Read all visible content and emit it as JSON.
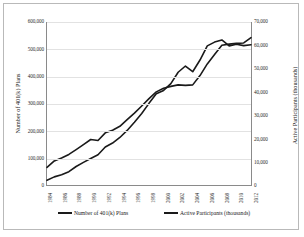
{
  "chart_data": {
    "type": "line",
    "title": "",
    "xlabel": "",
    "ylabel": "Number of 401(k) Plans",
    "y2label": "Active Participants (thousands)",
    "grid": true,
    "legend_position": "bottom",
    "x": [
      1984,
      1985,
      1986,
      1987,
      1988,
      1989,
      1990,
      1991,
      1992,
      1993,
      1994,
      1995,
      1996,
      1997,
      1998,
      1999,
      2000,
      2001,
      2002,
      2003,
      2004,
      2005,
      2006,
      2007,
      2008,
      2009,
      2010,
      2011,
      2012
    ],
    "xtick_labels": [
      "1984",
      "1986",
      "1988",
      "1990",
      "1992",
      "1994",
      "1996",
      "1998",
      "2000",
      "2002",
      "2004",
      "2006",
      "2008",
      "2010",
      "2012"
    ],
    "xtick_values": [
      1984,
      1986,
      1988,
      1990,
      1992,
      1994,
      1996,
      1998,
      2000,
      2002,
      2004,
      2006,
      2008,
      2010,
      2012
    ],
    "ylim": [
      0,
      600000
    ],
    "ytick_labels": [
      "0",
      "100,000",
      "200,000",
      "300,000",
      "400,000",
      "500,000",
      "600,000"
    ],
    "ytick_values": [
      0,
      100000,
      200000,
      300000,
      400000,
      500000,
      600000
    ],
    "y2lim": [
      0,
      70000
    ],
    "y2tick_labels": [
      "0",
      "10,000",
      "20,000",
      "30,000",
      "40,000",
      "50,000",
      "60,000",
      "70,000"
    ],
    "y2tick_values": [
      0,
      10000,
      20000,
      30000,
      40000,
      50000,
      60000,
      70000
    ],
    "series": [
      {
        "name": "Number of 401(k) Plans",
        "axis": "left",
        "color": "#1a1a1a",
        "values": [
          17303,
          29869,
          37420,
          49000,
          68121,
          83301,
          97614,
          111394,
          139704,
          154527,
          174945,
          200813,
          230808,
          263000,
          300593,
          335586,
          348043,
          373000,
          415000,
          438000,
          417000,
          460000,
          512000,
          526000,
          534000,
          512000,
          518000,
          513000,
          516000
        ]
      },
      {
        "name": "Active Participants (thousands)",
        "axis": "right",
        "color": "#1a1a1a",
        "values": [
          7540,
          10339,
          11559,
          13134,
          15203,
          17337,
          19548,
          19126,
          22404,
          23530,
          25205,
          28061,
          30843,
          33931,
          37114,
          39981,
          41564,
          42361,
          43000,
          42768,
          43000,
          47000,
          52000,
          56000,
          60000,
          60500,
          60800,
          61000,
          63300
        ]
      }
    ]
  },
  "legend": {
    "items": [
      {
        "label": "Number of 401(k) Plans"
      },
      {
        "label": "Active Participants (thousands)"
      }
    ]
  }
}
